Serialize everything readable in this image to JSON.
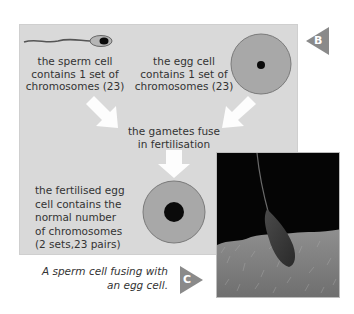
{
  "diagram": {
    "sperm_label": [
      "the sperm cell",
      "contains 1 set of",
      "chromosomes (23)"
    ],
    "egg_label": [
      "the egg cell",
      "contains 1 set of",
      "chromosomes (23)"
    ],
    "fusion_label": [
      "the gametes fuse",
      "in fertilisation"
    ],
    "fertilised_label": [
      "the fertilised egg",
      "cell contains the",
      "normal number",
      "of chromosomes",
      "(2 sets,23 pairs)"
    ],
    "badge_b": "B",
    "badge_c": "C",
    "photo_caption": [
      "A sperm cell fusing with",
      "an egg cell."
    ]
  },
  "colors": {
    "panel_bg": "#d9d9d9",
    "cell_fill": "#a8a8a8",
    "cell_outline": "#7a7a7a",
    "nucleus": "#0a0a0a",
    "arrow": "#ffffff",
    "badge": "#8a8a8a"
  },
  "icons": {
    "sperm": "sperm-cell-illustration",
    "egg": "egg-cell-illustration",
    "zygote": "fertilised-egg-illustration",
    "arrows": [
      "arrow-down-right-icon",
      "arrow-down-left-icon",
      "arrow-down-icon"
    ],
    "badges": [
      "triangle-left-badge-icon",
      "triangle-right-badge-icon"
    ]
  }
}
